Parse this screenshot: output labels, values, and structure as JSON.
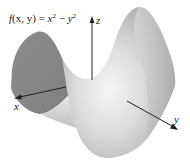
{
  "figure": {
    "formula": {
      "lhs_func": "f",
      "lhs_args": "(x, y)",
      "equals": " = ",
      "term1_base": "x",
      "term1_exp": "2",
      "minus": " − ",
      "term2_base": "y",
      "term2_exp": "2"
    },
    "axes": {
      "x": {
        "label": "x"
      },
      "y": {
        "label": "y"
      },
      "z": {
        "label": "z"
      }
    },
    "surface": {
      "name": "saddle surface (hyperbolic paraboloid)",
      "colors": {
        "light": "#f4f4f4",
        "mid": "#c8c8c8",
        "dark": "#8a8a8a",
        "shadow": "#7a7a7a"
      }
    },
    "axis_color": "#222222"
  }
}
